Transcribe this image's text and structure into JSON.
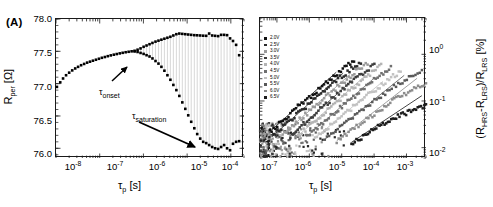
{
  "figure": {
    "panels": [
      "A",
      "B"
    ]
  },
  "panel_a": {
    "label": "(A)",
    "annotations": [
      {
        "name": "tau-onset",
        "tau": "τ",
        "sub": "onset"
      },
      {
        "name": "tau-saturation",
        "tau": "τ",
        "sub": "saturation"
      }
    ],
    "xaxis": {
      "title_main": "τ",
      "title_sub": "p",
      "title_unit": " [s]",
      "ticks": [
        "10",
        "10",
        "10",
        "10",
        "10"
      ],
      "exponents": [
        "-8",
        "-7",
        "-6",
        "-5",
        "-4"
      ]
    },
    "yaxis": {
      "title_main": "R",
      "title_sub": "per",
      "title_unit": " [Ω]",
      "ticks": [
        "78.0",
        "77.5",
        "77.0",
        "76.5",
        "76.0"
      ]
    }
  },
  "panel_b": {
    "label": "(B)",
    "legend": [
      {
        "label": "2.0V",
        "color": "#101010"
      },
      {
        "label": "2.5V",
        "color": "#2b2b2b"
      },
      {
        "label": "3.0V",
        "color": "#9a9a9a"
      },
      {
        "label": "3.5V",
        "color": "#3d3d3d"
      },
      {
        "label": "4.0V",
        "color": "#b4b4b4"
      },
      {
        "label": "4.5V",
        "color": "#6f6f6f"
      },
      {
        "label": "5.0V",
        "color": "#c2c2c2"
      },
      {
        "label": "5.5V",
        "color": "#585858"
      },
      {
        "label": "6.0V",
        "color": "#8c8c8c"
      },
      {
        "label": "6.5V",
        "color": "#1c1c1c"
      }
    ],
    "xaxis": {
      "title_main": "τ",
      "title_sub": "p",
      "title_unit": " [s]",
      "ticks": [
        "10",
        "10",
        "10",
        "10",
        "10"
      ],
      "exponents": [
        "-7",
        "-6",
        "-5",
        "-4",
        "-3"
      ]
    },
    "yaxis": {
      "title_parts": "(R",
      "title_sub1": "HRS",
      "title_mid": "-R",
      "title_sub2": "LRS",
      "title_mid2": ")/R",
      "title_sub3": "LRS",
      "title_unit": " [%]",
      "ticks": [
        "10",
        "10",
        "10"
      ],
      "exponents": [
        "0",
        "-1",
        "-2"
      ]
    }
  },
  "chart_data": [
    {
      "type": "scatter",
      "panel": "A",
      "title": "(A)",
      "xlabel": "τ_p [s]",
      "ylabel": "R_per [Ω]",
      "xscale": "log",
      "xlim": [
        1e-08,
        0.0002
      ],
      "ylim": [
        75.85,
        78.0
      ],
      "grid": false,
      "annotations": [
        "τ_onset",
        "τ_saturation"
      ],
      "series": [
        {
          "name": "upper-branch",
          "marker": "filled-square",
          "color": "#000000",
          "points": [
            [
              1.05e-08,
              76.95
            ],
            [
              1.25e-08,
              77.02
            ],
            [
              1.45e-08,
              77.08
            ],
            [
              1.7e-08,
              77.13
            ],
            [
              2e-08,
              77.17
            ],
            [
              2.35e-08,
              77.205
            ],
            [
              2.75e-08,
              77.235
            ],
            [
              3.2e-08,
              77.26
            ],
            [
              3.75e-08,
              77.285
            ],
            [
              4.4e-08,
              77.305
            ],
            [
              5.15e-08,
              77.325
            ],
            [
              6e-08,
              77.34
            ],
            [
              7e-08,
              77.355
            ],
            [
              8.2e-08,
              77.37
            ],
            [
              9.6e-08,
              77.385
            ],
            [
              1.12e-07,
              77.4
            ],
            [
              1.31e-07,
              77.412
            ],
            [
              1.53e-07,
              77.425
            ],
            [
              1.79e-07,
              77.437
            ],
            [
              2.1e-07,
              77.448
            ],
            [
              2.45e-07,
              77.458
            ],
            [
              2.87e-07,
              77.468
            ],
            [
              3.35e-07,
              77.477
            ],
            [
              3.92e-07,
              77.486
            ],
            [
              4.59e-07,
              77.493
            ],
            [
              5.37e-07,
              77.5
            ],
            [
              6.28e-07,
              77.508
            ],
            [
              7.35e-07,
              77.525
            ],
            [
              8.6e-07,
              77.545
            ],
            [
              1.01e-06,
              77.57
            ],
            [
              1.18e-06,
              77.59
            ],
            [
              1.38e-06,
              77.61
            ],
            [
              1.61e-06,
              77.63
            ],
            [
              1.89e-06,
              77.65
            ],
            [
              2.21e-06,
              77.665
            ],
            [
              2.58e-06,
              77.68
            ],
            [
              3.02e-06,
              77.695
            ],
            [
              3.54e-06,
              77.71
            ],
            [
              4.14e-06,
              77.725
            ],
            [
              4.84e-06,
              77.745
            ],
            [
              5.67e-06,
              77.765
            ],
            [
              6.63e-06,
              77.775
            ],
            [
              7.76e-06,
              77.77
            ],
            [
              9.08e-06,
              77.765
            ],
            [
              1.06e-05,
              77.76
            ],
            [
              1.24e-05,
              77.755
            ],
            [
              1.46e-05,
              77.75
            ],
            [
              1.7e-05,
              77.748
            ],
            [
              1.99e-05,
              77.745
            ],
            [
              2.33e-05,
              77.742
            ],
            [
              2.73e-05,
              77.74
            ],
            [
              3.19e-05,
              77.775
            ],
            [
              3.74e-05,
              77.745
            ],
            [
              4.37e-05,
              77.74
            ],
            [
              5.12e-05,
              77.735
            ],
            [
              5.99e-05,
              77.755
            ],
            [
              7.01e-05,
              77.755
            ],
            [
              8.2e-05,
              77.75
            ],
            [
              9.6e-05,
              77.7
            ],
            [
              0.000112,
              77.66
            ],
            [
              0.000132,
              77.6
            ],
            [
              0.000155,
              77.44
            ]
          ]
        },
        {
          "name": "lower-branch",
          "marker": "filled-square",
          "color": "#000000",
          "points": [
            [
              6.28e-07,
              77.498
            ],
            [
              7.35e-07,
              77.49
            ],
            [
              8.6e-07,
              77.475
            ],
            [
              1.01e-06,
              77.46
            ],
            [
              1.18e-06,
              77.44
            ],
            [
              1.38e-06,
              77.42
            ],
            [
              1.61e-06,
              77.39
            ],
            [
              1.89e-06,
              77.35
            ],
            [
              2.21e-06,
              77.31
            ],
            [
              2.58e-06,
              77.26
            ],
            [
              3.02e-06,
              77.2
            ],
            [
              3.54e-06,
              77.13
            ],
            [
              4.14e-06,
              77.06
            ],
            [
              4.84e-06,
              76.98
            ],
            [
              5.67e-06,
              76.9
            ],
            [
              6.63e-06,
              76.81
            ],
            [
              7.76e-06,
              76.71
            ],
            [
              9.08e-06,
              76.61
            ],
            [
              1.06e-05,
              76.51
            ],
            [
              1.24e-05,
              76.41
            ],
            [
              1.46e-05,
              76.31
            ],
            [
              1.7e-05,
              76.22
            ],
            [
              1.99e-05,
              76.15
            ],
            [
              2.33e-05,
              76.1
            ],
            [
              2.73e-05,
              76.08
            ],
            [
              3.19e-05,
              76.05
            ],
            [
              3.74e-05,
              76.02
            ],
            [
              4.37e-05,
              76.0
            ],
            [
              5.12e-05,
              75.99
            ],
            [
              5.99e-05,
              76.02
            ],
            [
              7.01e-05,
              76.05
            ],
            [
              8.2e-05,
              76.0
            ],
            [
              9.6e-05,
              75.97
            ],
            [
              0.000112,
              76.07
            ],
            [
              0.000132,
              76.1
            ],
            [
              0.000155,
              76.11
            ]
          ]
        }
      ]
    },
    {
      "type": "scatter",
      "panel": "B",
      "title": "(B)",
      "xlabel": "τ_p [s]",
      "ylabel": "(R_HRS-R_LRS)/R_LRS [%]",
      "xscale": "log",
      "yscale": "log",
      "xlim": [
        3e-08,
        0.004
      ],
      "ylim": [
        0.006,
        6.0
      ],
      "grid": false,
      "series": [
        {
          "name": "2.0V",
          "color": "#101010",
          "x0": 6e-08,
          "y0": 0.022,
          "slope": 0.62,
          "xsat": 8e-06,
          "ysat": 3.6
        },
        {
          "name": "2.5V",
          "color": "#2b2b2b",
          "x0": 9e-08,
          "y0": 0.02,
          "slope": 0.62,
          "xsat": 1.3e-05,
          "ysat": 3.5
        },
        {
          "name": "3.0V",
          "color": "#9a9a9a",
          "x0": 1.5e-07,
          "y0": 0.019,
          "slope": 0.62,
          "xsat": 2.1e-05,
          "ysat": 3.4
        },
        {
          "name": "3.5V",
          "color": "#3d3d3d",
          "x0": 2.6e-07,
          "y0": 0.018,
          "slope": 0.62,
          "xsat": 3.4e-05,
          "ysat": 3.3
        },
        {
          "name": "4.0V",
          "color": "#b4b4b4",
          "x0": 4.5e-07,
          "y0": 0.018,
          "slope": 0.62,
          "xsat": 5.5e-05,
          "ysat": 3.2
        },
        {
          "name": "4.5V",
          "color": "#6f6f6f",
          "x0": 8e-07,
          "y0": 0.017,
          "slope": 0.6,
          "xsat": 0.00011,
          "ysat": 3.0
        },
        {
          "name": "5.0V",
          "color": "#c2c2c2",
          "x0": 1.5e-06,
          "y0": 0.016,
          "slope": 0.58,
          "xsat": 0.00022,
          "ysat": 2.0
        },
        {
          "name": "5.5V",
          "color": "#585858",
          "x0": 3e-06,
          "y0": 0.015,
          "slope": 0.56,
          "xsat": 0.001,
          "ysat": 1.3
        },
        {
          "name": "6.0V",
          "color": "#8c8c8c",
          "x0": 7e-06,
          "y0": 0.014,
          "slope": 0.54,
          "xsat": 0.0025,
          "ysat": 0.55
        },
        {
          "name": "6.5V",
          "color": "#1c1c1c",
          "x0": 2e-05,
          "y0": 0.013,
          "slope": 0.52,
          "xsat": 0.0035,
          "ysat": 0.13
        }
      ]
    }
  ]
}
